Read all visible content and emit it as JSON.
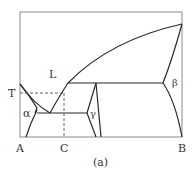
{
  "figure": {
    "caption": "(a)",
    "type": "binary phase diagram"
  },
  "axes": {
    "left_component": "A",
    "right_component": "B",
    "composition_marker": "C",
    "temperature_marker": "T"
  },
  "phases": {
    "liquid": "L",
    "alpha": "α",
    "gamma": "γ",
    "beta": "β"
  },
  "colors": {
    "line": "#2a2a2a",
    "frame": "#8a8a8a",
    "text": "#333333",
    "background": "#ffffff"
  },
  "geometry": {
    "frame": {
      "x1": 20,
      "y1": 12,
      "x2": 182,
      "y2": 137
    },
    "liquidus_left": "M20,84 Q34,104 50,113",
    "liquidus_main": "M50,113 Q60,95 68,83 Q110,40 182,24",
    "alpha_solvus_top": "M20,84 Q30,96 37,108 L35,113",
    "alpha_solvus_bottom": "M37,110 Q30,124 26,137",
    "eutectic_line": "M37,113 L87,113",
    "peritectic_line": "M68,83 L163,83",
    "gamma_left": "M96,83 L87,113 L96,137",
    "gamma_right": "M96,83 L101,137",
    "eutectoid_line": "M96,113 L101,113",
    "beta_upper": "M163,83 Q172,60 182,24",
    "beta_lower": "M163,83 Q175,100 182,137",
    "dashed_T": "M20,93 L64,93",
    "dashed_C": "M64,93 L64,137"
  }
}
